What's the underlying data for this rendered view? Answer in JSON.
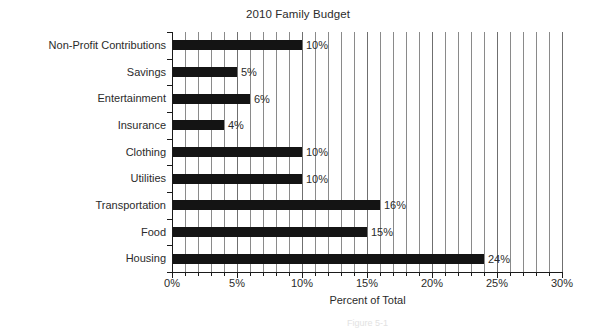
{
  "chart_data": {
    "type": "bar",
    "orientation": "horizontal",
    "title": "2010 Family Budget",
    "xlabel": "Percent of Total",
    "ylabel": "",
    "xlim": [
      0,
      30
    ],
    "xticks": [
      0,
      5,
      10,
      15,
      20,
      25,
      30
    ],
    "xtick_labels": [
      "0%",
      "5%",
      "10%",
      "15%",
      "20%",
      "25%",
      "30%"
    ],
    "minor_tick_interval": 1,
    "grid": "vertical-only",
    "legend": "none",
    "bar_color": "#141414",
    "categories": [
      "Non-Profit Contributions",
      "Savings",
      "Entertainment",
      "Insurance",
      "Clothing",
      "Utilities",
      "Transportation",
      "Food",
      "Housing"
    ],
    "values": [
      10,
      5,
      6,
      4,
      10,
      10,
      16,
      15,
      24
    ],
    "data_labels": [
      "10%",
      "5%",
      "6%",
      "4%",
      "10%",
      "10%",
      "16%",
      "15%",
      "24%"
    ]
  },
  "caption": "Figure 5-1"
}
